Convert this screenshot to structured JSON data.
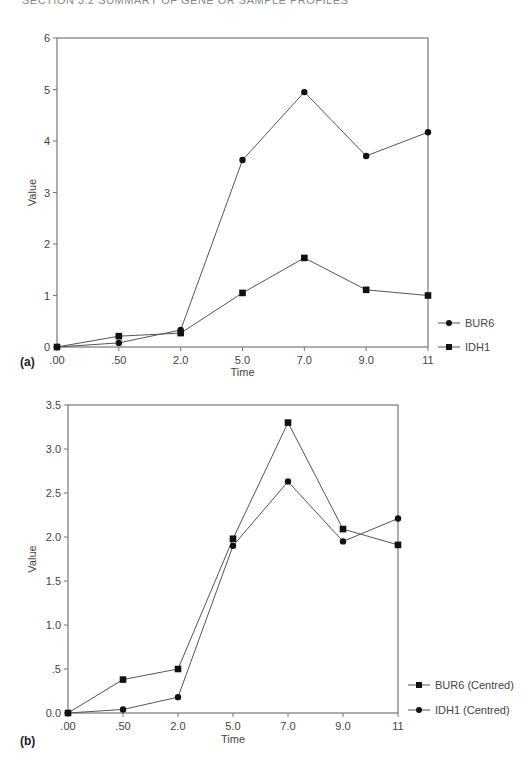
{
  "header": {
    "text": "SECTION 3.2  SUMMARY OF GENE OR SAMPLE PROFILES"
  },
  "chart_data": [
    {
      "panel": "(a)",
      "type": "line",
      "title": "",
      "xlabel": "Time",
      "ylabel": "Value",
      "categories": [
        ".00",
        ".50",
        "2.0",
        "5.0",
        "7.0",
        "9.0",
        "11"
      ],
      "ylim": [
        0,
        6
      ],
      "yticks": [
        "0",
        "1",
        "2",
        "3",
        "4",
        "5",
        "6"
      ],
      "grid": false,
      "legend_position": "right-bottom",
      "series": [
        {
          "name": "BUR6",
          "marker": "circle",
          "values": [
            0.0,
            0.08,
            0.33,
            3.63,
            4.95,
            3.71,
            4.17
          ]
        },
        {
          "name": "IDH1",
          "marker": "square",
          "values": [
            0.0,
            0.21,
            0.27,
            1.05,
            1.73,
            1.11,
            1.0
          ]
        }
      ]
    },
    {
      "panel": "(b)",
      "type": "line",
      "title": "",
      "xlabel": "Time",
      "ylabel": "Value",
      "categories": [
        ".00",
        ".50",
        "2.0",
        "5.0",
        "7.0",
        "9.0",
        "11"
      ],
      "ylim": [
        0,
        3.5
      ],
      "yticks": [
        "0.0",
        ".5",
        "1.0",
        "1.5",
        "2.0",
        "2.5",
        "3.0",
        "3.5"
      ],
      "grid": false,
      "legend_position": "right-bottom",
      "series": [
        {
          "name": "BUR6 (Centred)",
          "marker": "square",
          "values": [
            0.0,
            0.38,
            0.5,
            1.98,
            3.3,
            2.09,
            1.91
          ]
        },
        {
          "name": "IDH1 (Centred)",
          "marker": "circle",
          "values": [
            0.0,
            0.04,
            0.18,
            1.9,
            2.63,
            1.95,
            2.21
          ]
        }
      ]
    }
  ]
}
